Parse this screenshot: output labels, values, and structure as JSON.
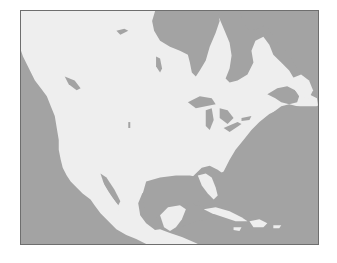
{
  "map": {
    "region": "North America",
    "style": "grayscale land/water",
    "colors": {
      "water": "#a3a3a3",
      "land": "#eeeeee",
      "border": "#6e6e6e"
    },
    "features": [
      "Hudson Bay",
      "Great Lakes",
      "Gulf of Mexico",
      "Caribbean Sea",
      "Gulf of California",
      "Gulf of St. Lawrence",
      "Pacific Ocean",
      "Atlantic Ocean"
    ]
  }
}
